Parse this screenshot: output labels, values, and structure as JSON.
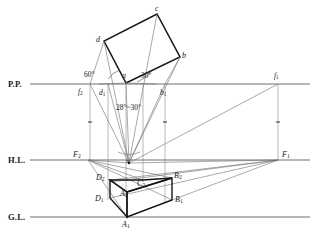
{
  "drawing": {
    "title": "Two-point perspective construction layout",
    "colors": {
      "ink": "#1a1a1a",
      "thin": "#6e6e6e",
      "background": "#ffffff"
    },
    "reference_lines": [
      {
        "id": "pp",
        "label": "P.P.",
        "y": 84
      },
      {
        "id": "hl",
        "label": "H.L.",
        "y": 160
      },
      {
        "id": "gl",
        "label": "G.L.",
        "y": 217
      }
    ],
    "plan_rectangle": {
      "vertices": [
        {
          "name": "a",
          "x": 126,
          "y": 83
        },
        {
          "name": "b",
          "x": 180,
          "y": 57
        },
        {
          "name": "c",
          "x": 157,
          "y": 14
        },
        {
          "name": "d",
          "x": 104,
          "y": 41
        }
      ]
    },
    "angles": [
      {
        "id": "angle-left",
        "label": "60°",
        "x": 90,
        "y": 72
      },
      {
        "id": "angle-right",
        "label": "30°",
        "x": 144,
        "y": 73
      },
      {
        "id": "cone-of-vision",
        "label": "28°~30°",
        "x": 119,
        "y": 106
      }
    ],
    "points": {
      "station_point": {
        "name": "s",
        "x": 129,
        "y": 163
      },
      "plan_trace": [
        {
          "name": "f",
          "sub": "2",
          "x": 90,
          "y": 84,
          "label_x": 79,
          "label_y": 88
        },
        {
          "name": "d",
          "sub": "1",
          "x": 108,
          "y": 84,
          "label_x": 101,
          "label_y": 90
        },
        {
          "name": "b",
          "sub": "1",
          "x": 165,
          "y": 84,
          "label_x": 161,
          "label_y": 90
        },
        {
          "name": "f",
          "sub": "1",
          "x": 278,
          "y": 84,
          "label_x": 274,
          "label_y": 74
        }
      ],
      "vanishing_points": [
        {
          "name": "F",
          "sub": "2",
          "x": 88,
          "y": 160,
          "label_x": 74,
          "label_y": 152
        },
        {
          "name": "F",
          "sub": "1",
          "x": 278,
          "y": 160,
          "label_x": 281,
          "label_y": 152
        }
      ],
      "perspective_box": [
        {
          "name": "D",
          "sub": "2",
          "x": 110,
          "y": 180,
          "label_x": 97,
          "label_y": 176
        },
        {
          "name": "C",
          "sub": "2",
          "x": 143,
          "y": 180,
          "label_x": 138,
          "label_y": 182
        },
        {
          "name": "B",
          "sub": "2",
          "x": 172,
          "y": 178,
          "label_x": 174,
          "label_y": 174
        },
        {
          "name": "A",
          "sub": "2",
          "x": 127,
          "y": 192,
          "label_x": 121,
          "label_y": 193
        },
        {
          "name": "D",
          "sub": "1",
          "x": 110,
          "y": 198,
          "label_x": 96,
          "label_y": 197
        },
        {
          "name": "B",
          "sub": "1",
          "x": 172,
          "y": 200,
          "label_x": 175,
          "label_y": 198
        },
        {
          "name": "A",
          "sub": "1",
          "x": 127,
          "y": 217,
          "label_x": 123,
          "label_y": 224
        }
      ]
    }
  }
}
